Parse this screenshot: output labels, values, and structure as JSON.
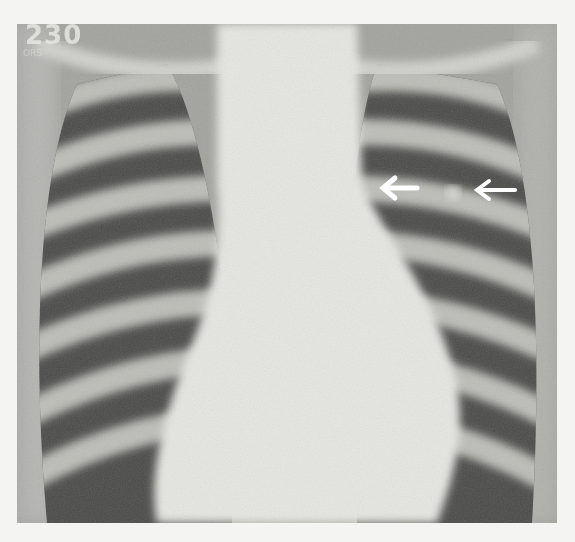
{
  "image": {
    "subject": "chest x-ray, posteroanterior view",
    "corner_label": "230",
    "corner_sublabel": "ORS",
    "annotations": [
      {
        "type": "arrow",
        "direction": "left",
        "color": "#ffffff",
        "x": 400,
        "y": 188
      },
      {
        "type": "arrow",
        "direction": "left",
        "color": "#ffffff",
        "x": 498,
        "y": 190
      }
    ],
    "finding": {
      "type": "nodule",
      "x": 453,
      "y": 193
    }
  }
}
